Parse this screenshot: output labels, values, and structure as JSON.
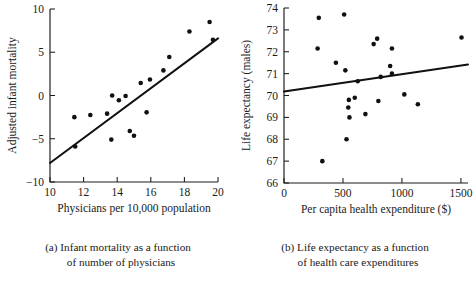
{
  "figure": {
    "name": "two-panel-scatterplot-figure",
    "background": "#ffffff",
    "ink_color": "#111111"
  },
  "panels": [
    {
      "key": "a",
      "caption_line1": "(a) Infant mortality as a function",
      "caption_line2": "of number of physicians"
    },
    {
      "key": "b",
      "caption_line1": "(b) Life expectancy as a function",
      "caption_line2": "of health care expenditures"
    }
  ],
  "chart_data": [
    {
      "type": "scatter",
      "panel": "a",
      "title": "",
      "xlabel": "Physicians per 10,000 population",
      "ylabel": "Adjusted infant mortality",
      "xlim": [
        10,
        20
      ],
      "ylim": [
        -10,
        10
      ],
      "xticks": [
        10,
        12,
        14,
        16,
        18,
        20
      ],
      "xticklabels": [
        "10",
        "12",
        "14",
        "16",
        "18",
        "20"
      ],
      "yticks": [
        -10,
        -5,
        0,
        5,
        10
      ],
      "yticklabels": [
        "-10",
        "-5",
        "0",
        "5",
        "10"
      ],
      "grid": false,
      "legend": "none",
      "points": [
        {
          "x": 11.45,
          "y": -2.5
        },
        {
          "x": 11.5,
          "y": -5.9
        },
        {
          "x": 12.4,
          "y": -2.25
        },
        {
          "x": 13.4,
          "y": -2.1
        },
        {
          "x": 13.65,
          "y": -5.1
        },
        {
          "x": 13.7,
          "y": 0.0
        },
        {
          "x": 14.1,
          "y": -0.55
        },
        {
          "x": 14.5,
          "y": -0.05
        },
        {
          "x": 14.75,
          "y": -4.1
        },
        {
          "x": 15.0,
          "y": -4.65
        },
        {
          "x": 15.4,
          "y": 1.45
        },
        {
          "x": 15.75,
          "y": -1.95
        },
        {
          "x": 15.95,
          "y": 1.85
        },
        {
          "x": 16.75,
          "y": 2.9
        },
        {
          "x": 17.1,
          "y": 4.45
        },
        {
          "x": 18.3,
          "y": 7.4
        },
        {
          "x": 19.5,
          "y": 8.5
        },
        {
          "x": 19.7,
          "y": 6.45
        }
      ],
      "regression_line": {
        "x0": 10.0,
        "y0": -7.8,
        "x1": 20.0,
        "y1": 6.6
      }
    },
    {
      "type": "scatter",
      "panel": "b",
      "title": "",
      "xlabel": "Per capita health expenditure ($)",
      "ylabel": "Life expectancy (males)",
      "xlim": [
        0,
        1560
      ],
      "ylim": [
        66,
        74
      ],
      "xticks": [
        0,
        500,
        1000,
        1500
      ],
      "xticklabels": [
        "0",
        "500",
        "1000",
        "1500"
      ],
      "yticks": [
        66,
        67,
        68,
        69,
        70,
        71,
        72,
        73,
        74
      ],
      "yticklabels": [
        "66",
        "67",
        "68",
        "69",
        "70",
        "71",
        "72",
        "73",
        "74"
      ],
      "grid": false,
      "legend": "none",
      "points": [
        {
          "x": 285,
          "y": 72.15
        },
        {
          "x": 295,
          "y": 73.55
        },
        {
          "x": 325,
          "y": 67.0
        },
        {
          "x": 440,
          "y": 71.5
        },
        {
          "x": 510,
          "y": 73.7
        },
        {
          "x": 520,
          "y": 71.15
        },
        {
          "x": 530,
          "y": 68.0
        },
        {
          "x": 545,
          "y": 69.45
        },
        {
          "x": 550,
          "y": 69.8
        },
        {
          "x": 555,
          "y": 69.0
        },
        {
          "x": 600,
          "y": 69.9
        },
        {
          "x": 625,
          "y": 70.65
        },
        {
          "x": 690,
          "y": 69.15
        },
        {
          "x": 760,
          "y": 72.35
        },
        {
          "x": 790,
          "y": 72.6
        },
        {
          "x": 800,
          "y": 69.75
        },
        {
          "x": 820,
          "y": 70.85
        },
        {
          "x": 900,
          "y": 71.35
        },
        {
          "x": 915,
          "y": 72.15
        },
        {
          "x": 915,
          "y": 71.0
        },
        {
          "x": 1020,
          "y": 70.05
        },
        {
          "x": 1135,
          "y": 69.6
        },
        {
          "x": 1505,
          "y": 72.65
        }
      ],
      "regression_line": {
        "x0": 0,
        "y0": 70.18,
        "x1": 1560,
        "y1": 71.42
      }
    }
  ]
}
